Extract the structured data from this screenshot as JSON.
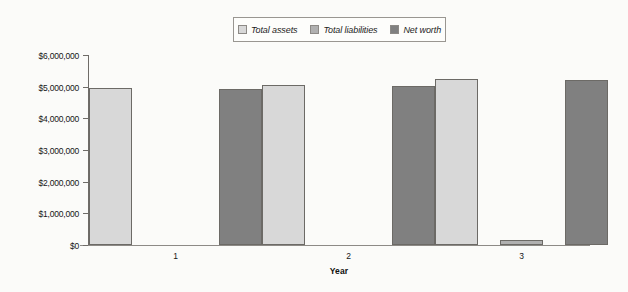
{
  "chart_data": {
    "type": "bar",
    "title": "",
    "subtitle": "",
    "xlabel": "Year",
    "ylabel": "",
    "categories": [
      "1",
      "2",
      "3"
    ],
    "series": [
      {
        "name": "Total assets",
        "color": "#d8d8d8",
        "values": [
          4960000,
          5060000,
          5230000
        ]
      },
      {
        "name": "Total liabilities",
        "color": "#b0b0b0",
        "values": [
          0,
          0,
          150000
        ]
      },
      {
        "name": "Net worth",
        "color": "#808080",
        "values": [
          4940000,
          5030000,
          5200000
        ]
      }
    ],
    "ylim": [
      0,
      6000000
    ],
    "ytick_labels": [
      "$6,000,000",
      "$5,000,000",
      "$4,000,000",
      "$3,000,000",
      "$2,000,000",
      "$1,000,000",
      "$0"
    ],
    "ytick_values": [
      6000000,
      5000000,
      4000000,
      3000000,
      2000000,
      1000000,
      0
    ],
    "grid": false,
    "legend_position": "top-center"
  },
  "legend": {
    "entries": [
      {
        "label": "Total assets",
        "color": "#d8d8d8"
      },
      {
        "label": "Total liabilities",
        "color": "#b0b0b0"
      },
      {
        "label": "Net worth",
        "color": "#808080"
      }
    ]
  },
  "axis": {
    "x_title": "Year"
  }
}
